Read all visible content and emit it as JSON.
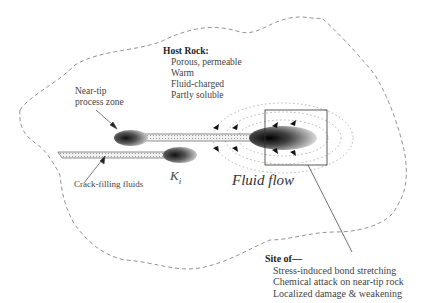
{
  "host_rock": {
    "title": "Host Rock:",
    "properties": [
      "Porous, permeable",
      "Warm",
      "Fluid-charged",
      "Partly soluble"
    ]
  },
  "labels": {
    "process_zone_line1": "Near-tip",
    "process_zone_line2": "process zone",
    "crack_fluids": "Crack-filling fluids",
    "k_symbol": "K",
    "k_subscript": "i",
    "fluid_flow": "Fluid flow"
  },
  "site_of": {
    "title": "Site of—",
    "items": [
      "Stress-induced bond stretching",
      "Chemical attack on near-tip rock",
      "Localized damage & weakening"
    ]
  }
}
